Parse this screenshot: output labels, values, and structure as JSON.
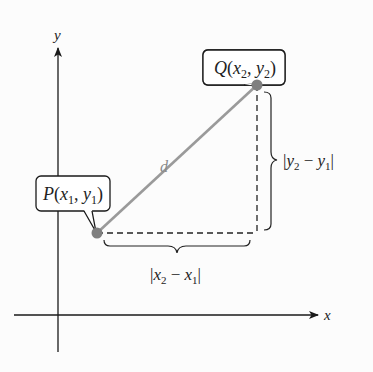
{
  "diagram": {
    "axes": {
      "x_label": "x",
      "y_label": "y"
    },
    "points": {
      "P": {
        "name": "P",
        "label": "P(x₁, y₁)",
        "x_sub": "1",
        "y_sub": "1"
      },
      "Q": {
        "name": "Q",
        "label": "Q(x₂, y₂)",
        "x_sub": "2",
        "y_sub": "2"
      }
    },
    "segment_label": "d",
    "horizontal_brace_label": "|x₂ − x₁|",
    "vertical_brace_label": "|y₂ − y₁|",
    "colors": {
      "segment": "#9a9a9a",
      "point": "#7f7f7f",
      "axis": "#1a1a1a",
      "dashed": "#222222"
    }
  }
}
